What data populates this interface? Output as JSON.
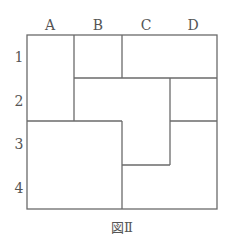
{
  "figure": {
    "caption": "図Ⅱ",
    "column_labels": [
      "A",
      "B",
      "C",
      "D"
    ],
    "row_labels": [
      "1",
      "2",
      "3",
      "4"
    ],
    "grid": {
      "columns": 4,
      "rows": 4
    },
    "regions": [
      {
        "name": "region-a1-a2",
        "cells": [
          "A1",
          "A2"
        ]
      },
      {
        "name": "region-b1",
        "cells": [
          "B1"
        ]
      },
      {
        "name": "region-c1-d1",
        "cells": [
          "C1",
          "D1"
        ]
      },
      {
        "name": "region-b2-c2-c3",
        "cells": [
          "B2",
          "C2",
          "C3"
        ]
      },
      {
        "name": "region-d2",
        "cells": [
          "D2"
        ]
      },
      {
        "name": "region-a3-b3-a4-b4",
        "cells": [
          "A3",
          "B3",
          "A4",
          "B4"
        ]
      },
      {
        "name": "region-d3-c4-d4",
        "cells": [
          "D3",
          "C4",
          "D4"
        ]
      }
    ]
  }
}
